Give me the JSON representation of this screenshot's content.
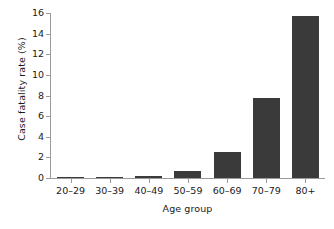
{
  "chart_data": {
    "type": "bar",
    "title": "",
    "subtitle": "",
    "xlabel": "Age group",
    "ylabel": "Case fatality rate (%)",
    "categories": [
      "20–29",
      "30–39",
      "40–49",
      "50–59",
      "60–69",
      "70–79",
      "80+"
    ],
    "values": [
      0.03,
      0.06,
      0.15,
      0.7,
      2.5,
      7.8,
      15.7
    ],
    "series": [
      {
        "name": "Case fatality rate",
        "values": [
          0.03,
          0.06,
          0.15,
          0.7,
          2.5,
          7.8,
          15.7
        ]
      }
    ],
    "ylim": [
      0,
      16
    ],
    "yticks": [
      0,
      2,
      4,
      6,
      8,
      10,
      12,
      14,
      16
    ],
    "ytick_labels": [
      "0",
      "2",
      "4",
      "6",
      "8",
      "10",
      "12",
      "14",
      "16"
    ],
    "grid": false,
    "legend": false,
    "legend_position": "none",
    "bar_color": "#3a3a3a",
    "axis_color": "#9a9a9a",
    "text_color": "#1a1a1a",
    "background_color": "#ffffff",
    "annotations": []
  }
}
